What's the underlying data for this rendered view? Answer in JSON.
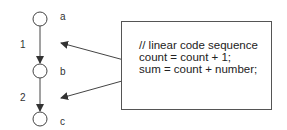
{
  "diagram": {
    "nodes": [
      {
        "id": "a",
        "label": "a"
      },
      {
        "id": "b",
        "label": "b"
      },
      {
        "id": "c",
        "label": "c"
      }
    ],
    "edges": [
      {
        "from": "a",
        "to": "b",
        "label": "1"
      },
      {
        "from": "b",
        "to": "c",
        "label": "2"
      }
    ],
    "code": {
      "lines": [
        "// linear code sequence",
        "count = count + 1;",
        "sum = count + number;"
      ]
    },
    "colors": {
      "stroke": "#444444",
      "text": "#222222",
      "background": "#ffffff"
    }
  }
}
